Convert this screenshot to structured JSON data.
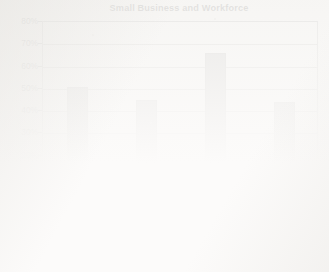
{
  "chart_data": {
    "type": "bar",
    "title": "Small Business and Workforce",
    "xlabel": "",
    "ylabel": "",
    "ylim": [
      0,
      80
    ],
    "ytick_labels": [
      "80%",
      "70%",
      "60%",
      "50%",
      "40%",
      "30%",
      "20%",
      "10%",
      "0%"
    ],
    "ytick_values": [
      80,
      70,
      60,
      50,
      40,
      30,
      20,
      10,
      0
    ],
    "grid": true,
    "legend": "none",
    "bar_color": "#787878",
    "bar_edge_color": "#5d5d5d",
    "categories": [
      "Employ 50% of all private-sector employees",
      "Pay 44% of private-sector payroll",
      "Generate 65% of new jobs",
      "Hire 43% of high-tech workers"
    ],
    "category_lines": [
      [
        "Employ 50% of",
        "all private-sector",
        "employees"
      ],
      [
        "Pay 44% of",
        "private-sector",
        "payroll"
      ],
      [
        "Generate 65%",
        "of new jobs"
      ],
      [
        "Hire 43% of",
        "high-tech",
        "workers"
      ]
    ],
    "values": [
      50,
      44,
      65,
      43
    ]
  }
}
